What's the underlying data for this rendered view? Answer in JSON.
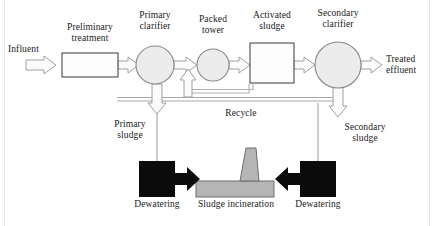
{
  "diagram": {
    "type": "process-flow",
    "colors": {
      "vessel_fill": "#ececec",
      "vessel_stroke": "#8a8a8a",
      "box_fill": "#fdfdfd",
      "box_stroke": "#4a4a4a",
      "hollow_arrow_fill": "#fbfbfb",
      "hollow_arrow_stroke": "#a0a0a0",
      "solid_black": "#0b0b0b",
      "incinerator_fill": "#b5b5b5",
      "incinerator_stroke": "#6f6f6f",
      "pipe_stroke": "#9a9a9a",
      "text": "#1a1a1a",
      "frame": "#e9e9e9",
      "background": "#ffffff"
    },
    "units": [
      {
        "id": "preliminary-treatment",
        "label": "Preliminary\ntreatment",
        "shape": "rectangle",
        "x": 62,
        "y": 53,
        "width": 56,
        "height": 24,
        "label_x": 62,
        "label_y": 22,
        "label_width": 56
      },
      {
        "id": "primary-clarifier",
        "label": "Primary\nclarifier",
        "shape": "circle",
        "cx": 155,
        "cy": 65,
        "r": 19,
        "label_x": 126,
        "label_y": 10,
        "label_width": 58
      },
      {
        "id": "packed-tower",
        "label": "Packed\ntower",
        "shape": "circle",
        "cx": 213,
        "cy": 65,
        "r": 16,
        "label_x": 185,
        "label_y": 14,
        "label_width": 56
      },
      {
        "id": "activated-sludge",
        "label": "Activated\nsludge",
        "shape": "rectangle",
        "x": 250,
        "y": 43,
        "width": 44,
        "height": 40,
        "label_x": 248,
        "label_y": 10,
        "label_width": 48
      },
      {
        "id": "secondary-clarifier",
        "label": "Secondary\nclarifier",
        "shape": "circle",
        "cx": 338,
        "cy": 65,
        "r": 23,
        "label_x": 306,
        "label_y": 8,
        "label_width": 64
      },
      {
        "id": "dewatering-primary",
        "label": "Dewatering",
        "shape": "solid-box",
        "x": 139,
        "y": 161,
        "width": 36,
        "height": 36,
        "label_x": 123,
        "label_y": 199,
        "label_width": 68
      },
      {
        "id": "sludge-incineration",
        "label": "Sludge incineration",
        "shape": "incinerator",
        "x": 196,
        "y": 181,
        "width": 78,
        "height": 16,
        "stack": {
          "x_top_left": 246,
          "x_top_right": 256,
          "x_bot_left": 240,
          "x_bot_right": 259,
          "y_top": 148,
          "y_bot": 181
        },
        "label_x": 191,
        "label_y": 199,
        "label_width": 90
      },
      {
        "id": "dewatering-secondary",
        "label": "Dewatering",
        "shape": "solid-box",
        "x": 300,
        "y": 161,
        "width": 36,
        "height": 36,
        "label_x": 284,
        "label_y": 199,
        "label_width": 68
      }
    ],
    "streams": [
      {
        "id": "influent",
        "label": "Influent",
        "label_x": 8,
        "label_y": 44,
        "label_width": 44,
        "arrow": "hollow-right"
      },
      {
        "id": "treated-effluent",
        "label": "Treated\neffluent",
        "label_x": 386,
        "label_y": 54,
        "label_width": 44,
        "arrow": "hollow-right"
      },
      {
        "id": "recycle",
        "label": "Recycle",
        "label_x": 216,
        "label_y": 108,
        "label_width": 50,
        "arrow": "hollow-up"
      },
      {
        "id": "primary-sludge",
        "label": "Primary\nsludge",
        "label_x": 104,
        "label_y": 119,
        "label_width": 52,
        "arrow": "hollow-down"
      },
      {
        "id": "secondary-sludge",
        "label": "Secondary\nsludge",
        "label_x": 334,
        "label_y": 122,
        "label_width": 62,
        "arrow": "hollow-down"
      }
    ]
  }
}
